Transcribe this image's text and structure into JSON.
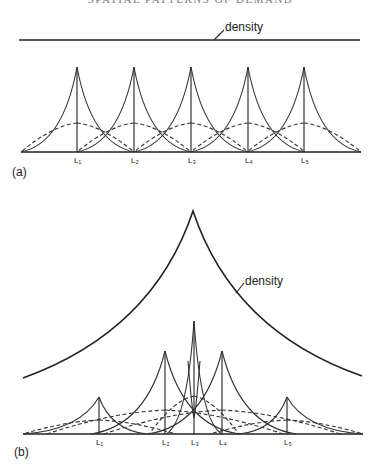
{
  "header": {
    "title": "SPATIAL PATTERNS OF DEMAND"
  },
  "panel_a": {
    "label": "(a)",
    "density_label": "density",
    "baseline": {
      "y": 152,
      "x0": 21,
      "x1": 361
    },
    "density_line": {
      "y": 40,
      "x0": 19,
      "x1": 360
    },
    "peak_y": 67,
    "dash_peak_y": 123,
    "spacing": 57,
    "locations": [
      {
        "name": "L₁",
        "x": 77
      },
      {
        "name": "L₂",
        "x": 134
      },
      {
        "name": "L₃",
        "x": 191
      },
      {
        "name": "L₄",
        "x": 248
      },
      {
        "name": "L₅",
        "x": 304
      }
    ]
  },
  "panel_b": {
    "label": "(b)",
    "density_label": "density",
    "baseline": {
      "y": 434,
      "x0": 23,
      "x1": 363
    },
    "density_curve": {
      "left": [
        23,
        378
      ],
      "peak": [
        193,
        211
      ],
      "right": [
        362,
        376
      ]
    },
    "locations": [
      {
        "name": "L₁",
        "x": 99,
        "peak_y": 397,
        "dash_y": 420,
        "reach": 48
      },
      {
        "name": "L₂",
        "x": 165,
        "peak_y": 351,
        "dash_y": 410,
        "reach": 74
      },
      {
        "name": "L₃",
        "x": 194,
        "peak_y": 321,
        "dash_y": 396,
        "reach": 28
      },
      {
        "name": "L₄",
        "x": 222,
        "peak_y": 351,
        "dash_y": 410,
        "reach": 74
      },
      {
        "name": "L₅",
        "x": 287,
        "peak_y": 397,
        "dash_y": 420,
        "reach": 48
      }
    ]
  }
}
